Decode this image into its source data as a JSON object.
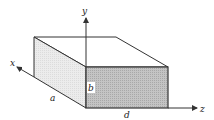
{
  "diagram": {
    "type": "rectangular-box-waveguide",
    "labels": {
      "x_axis": "x",
      "y_axis": "y",
      "z_axis": "z",
      "width": "a",
      "height": "b",
      "length": "d"
    },
    "colors": {
      "stroke": "#333333",
      "side_face": "#e8e8e8",
      "front_face": "#bdbdbd",
      "top_face": "#ffffff",
      "axis": "#333333"
    }
  }
}
